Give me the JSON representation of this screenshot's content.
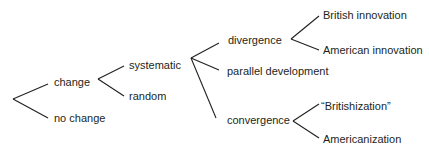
{
  "diagram": {
    "type": "tree",
    "orientation": "left-to-right",
    "line_color": "#231f20",
    "nodes": {
      "change": "change",
      "no_change": "no change",
      "systematic": "systematic",
      "random": "random",
      "divergence": "divergence",
      "parallel_development": "parallel development",
      "convergence": "convergence",
      "british_innovation": "British innovation",
      "american_innovation": "American innovation",
      "britishization": "“Britishization”",
      "americanization": "Americanization"
    },
    "edges": [
      [
        "root",
        "change"
      ],
      [
        "root",
        "no change"
      ],
      [
        "change",
        "systematic"
      ],
      [
        "change",
        "random"
      ],
      [
        "systematic",
        "divergence"
      ],
      [
        "systematic",
        "parallel development"
      ],
      [
        "systematic",
        "convergence"
      ],
      [
        "divergence",
        "British innovation"
      ],
      [
        "divergence",
        "American innovation"
      ],
      [
        "convergence",
        "“Britishization”"
      ],
      [
        "convergence",
        "Americanization"
      ]
    ]
  }
}
